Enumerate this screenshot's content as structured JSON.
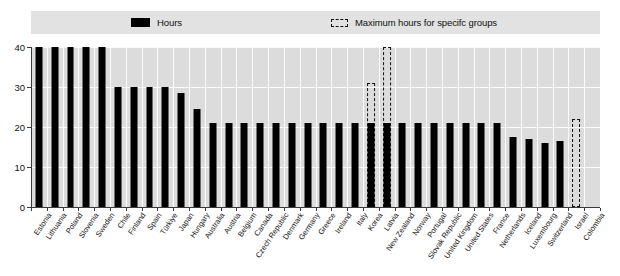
{
  "legend": {
    "items": [
      {
        "key": "hours",
        "label": "Hours",
        "swatch": "solid-black-square-icon",
        "color": "#000000"
      },
      {
        "key": "max_hours",
        "label": "Maximum hours for specifc groups",
        "swatch": "dashed-outline-square-icon",
        "color": "#111111"
      }
    ]
  },
  "axis": {
    "y_ticks": [
      0,
      10,
      20,
      30,
      40
    ],
    "y_tick_labels": [
      "0",
      "10",
      "20",
      "30",
      "40"
    ]
  },
  "chart_data": {
    "type": "bar",
    "title": "",
    "xlabel": "",
    "ylabel": "",
    "ylim": [
      0,
      40
    ],
    "yticks": [
      0,
      10,
      20,
      30,
      40
    ],
    "grid": true,
    "legend_position": "top",
    "categories": [
      "Estonia",
      "Lithuania",
      "Poland",
      "Slovenia",
      "Sweden",
      "Chile",
      "Finland",
      "Spain",
      "Türkiye",
      "Japan",
      "Hungary",
      "Australia",
      "Austria",
      "Belgium",
      "Canada",
      "Czech Republic",
      "Denmark",
      "Germany",
      "Greece",
      "Ireland",
      "Italy",
      "Korea",
      "Latvia",
      "New Zealand",
      "Norway",
      "Portugal",
      "Slovak Republic",
      "United Kingdom",
      "United States",
      "France",
      "Netherlands",
      "Iceland",
      "Luxembourg",
      "Switzerland",
      "Israel",
      "Colombia"
    ],
    "series": [
      {
        "name": "Hours",
        "style": "solid",
        "color": "#000000",
        "values": [
          40,
          40,
          40,
          40,
          40,
          30,
          30,
          30,
          30,
          28.5,
          24.5,
          21,
          21,
          21,
          21,
          21,
          21,
          21,
          21,
          21,
          21,
          21,
          21,
          21,
          21,
          21,
          21,
          21,
          21,
          21,
          17.5,
          17,
          16,
          16.5,
          null,
          null
        ]
      },
      {
        "name": "Maximum hours for specifc groups",
        "style": "dashed-outline",
        "color": "#111111",
        "values": [
          null,
          null,
          null,
          null,
          null,
          null,
          null,
          null,
          null,
          null,
          null,
          null,
          null,
          null,
          null,
          null,
          null,
          null,
          null,
          null,
          null,
          31,
          40,
          null,
          null,
          null,
          null,
          null,
          null,
          null,
          null,
          null,
          null,
          null,
          22,
          null
        ]
      }
    ]
  }
}
